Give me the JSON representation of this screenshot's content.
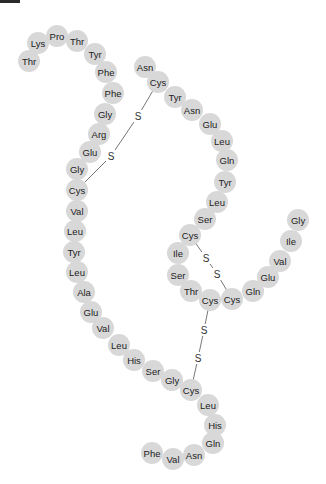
{
  "title_bar": {
    "color": "#2a2a2a"
  },
  "style": {
    "residue_fill": "#d8d8d8",
    "text_color": "#222222",
    "bond_color": "#555555",
    "residue_radius": 11
  },
  "chains": {
    "A": {
      "residues": [
        {
          "label": "Gly",
          "x": 298,
          "y": 220
        },
        {
          "label": "Ile",
          "x": 291,
          "y": 241
        },
        {
          "label": "Val",
          "x": 280,
          "y": 261
        },
        {
          "label": "Glu",
          "x": 268,
          "y": 277
        },
        {
          "label": "Gln",
          "x": 253,
          "y": 291
        },
        {
          "label": "Cys",
          "x": 232,
          "y": 299
        },
        {
          "label": "Cys",
          "x": 210,
          "y": 300
        },
        {
          "label": "Thr",
          "x": 191,
          "y": 291
        },
        {
          "label": "Ser",
          "x": 178,
          "y": 275
        },
        {
          "label": "Ile",
          "x": 178,
          "y": 253
        },
        {
          "label": "Cys",
          "x": 190,
          "y": 235
        },
        {
          "label": "Ser",
          "x": 205,
          "y": 219
        },
        {
          "label": "Leu",
          "x": 217,
          "y": 202
        },
        {
          "label": "Tyr",
          "x": 225,
          "y": 182
        },
        {
          "label": "Gln",
          "x": 227,
          "y": 160
        },
        {
          "label": "Leu",
          "x": 222,
          "y": 141
        },
        {
          "label": "Glu",
          "x": 210,
          "y": 124
        },
        {
          "label": "Asn",
          "x": 192,
          "y": 110
        },
        {
          "label": "Tyr",
          "x": 175,
          "y": 97
        },
        {
          "label": "Cys",
          "x": 158,
          "y": 82
        },
        {
          "label": "Asn",
          "x": 145,
          "y": 67
        }
      ]
    },
    "B": {
      "residues": [
        {
          "label": "Phe",
          "x": 152,
          "y": 453
        },
        {
          "label": "Val",
          "x": 173,
          "y": 459
        },
        {
          "label": "Asn",
          "x": 194,
          "y": 455
        },
        {
          "label": "Gln",
          "x": 213,
          "y": 443
        },
        {
          "label": "His",
          "x": 215,
          "y": 425
        },
        {
          "label": "Leu",
          "x": 208,
          "y": 405
        },
        {
          "label": "Cys",
          "x": 191,
          "y": 390
        },
        {
          "label": "Gly",
          "x": 172,
          "y": 380
        },
        {
          "label": "Ser",
          "x": 153,
          "y": 371
        },
        {
          "label": "His",
          "x": 134,
          "y": 360
        },
        {
          "label": "Leu",
          "x": 119,
          "y": 345
        },
        {
          "label": "Val",
          "x": 103,
          "y": 328
        },
        {
          "label": "Glu",
          "x": 91,
          "y": 312
        },
        {
          "label": "Ala",
          "x": 84,
          "y": 292
        },
        {
          "label": "Leu",
          "x": 77,
          "y": 272
        },
        {
          "label": "Tyr",
          "x": 74,
          "y": 252
        },
        {
          "label": "Leu",
          "x": 75,
          "y": 231
        },
        {
          "label": "Val",
          "x": 77,
          "y": 211
        },
        {
          "label": "Cys",
          "x": 77,
          "y": 190
        },
        {
          "label": "Gly",
          "x": 77,
          "y": 169
        },
        {
          "label": "Glu",
          "x": 90,
          "y": 152
        },
        {
          "label": "Arg",
          "x": 99,
          "y": 134
        },
        {
          "label": "Gly",
          "x": 105,
          "y": 114
        },
        {
          "label": "Phe",
          "x": 113,
          "y": 93
        },
        {
          "label": "Phe",
          "x": 106,
          "y": 72
        },
        {
          "label": "Tyr",
          "x": 95,
          "y": 54
        },
        {
          "label": "Thr",
          "x": 77,
          "y": 41
        },
        {
          "label": "Pro",
          "x": 57,
          "y": 36
        },
        {
          "label": "Lys",
          "x": 38,
          "y": 43
        },
        {
          "label": "Thr",
          "x": 29,
          "y": 61
        }
      ]
    }
  },
  "disulfide_bonds": [
    {
      "from": [
        158,
        82
      ],
      "to": [
        77,
        190
      ],
      "s1": {
        "label": "S",
        "x": 138,
        "y": 116
      },
      "s2": {
        "label": "S",
        "x": 111,
        "y": 156
      }
    },
    {
      "from": [
        190,
        235
      ],
      "to": [
        232,
        299
      ],
      "s1": {
        "label": "S",
        "x": 206,
        "y": 258
      },
      "s2": {
        "label": "S",
        "x": 217,
        "y": 274
      }
    },
    {
      "from": [
        210,
        300
      ],
      "to": [
        191,
        390
      ],
      "s1": {
        "label": "S",
        "x": 204,
        "y": 330
      },
      "s2": {
        "label": "S",
        "x": 198,
        "y": 358
      }
    }
  ]
}
